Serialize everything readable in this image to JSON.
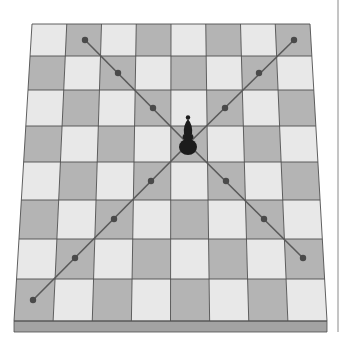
{
  "figure": {
    "description": "Chessboard in perspective with a dark bishop at the center and its diagonal lines of movement marked with dots",
    "piece": {
      "type": "bishop",
      "color": "black",
      "icon": "bishop-icon",
      "row": 3,
      "col": 4
    },
    "colors": {
      "light_square": "#e8e8e8",
      "dark_square": "#b4b4b4",
      "grid_line": "#4f4f4f",
      "board_edge": "#a3a3a3",
      "move_line": "#5a5a5a",
      "move_dot": "#4a4a4a",
      "piece": "#1c1c1c",
      "frame_line": "#8a8a8a"
    },
    "board": {
      "rows": 8,
      "cols": 8,
      "top_left": [
        32,
        24
      ],
      "top_right": [
        310,
        24
      ],
      "bottom_left": [
        14,
        321
      ],
      "bottom_right": [
        327,
        321
      ],
      "row_y": [
        24,
        56,
        90,
        126,
        162,
        200,
        239,
        279,
        321
      ],
      "edge_depth": 11,
      "top_row_starts_with": "light"
    },
    "diagonals": [
      {
        "name": "up-left",
        "from": [
          188,
          144
        ],
        "to": [
          85,
          40
        ],
        "dots": [
          [
            153,
            108
          ],
          [
            118,
            73
          ],
          [
            85,
            40
          ]
        ]
      },
      {
        "name": "up-right",
        "from": [
          188,
          144
        ],
        "to": [
          294,
          40
        ],
        "dots": [
          [
            225,
            108
          ],
          [
            259,
            73
          ],
          [
            294,
            40
          ]
        ]
      },
      {
        "name": "down-left",
        "from": [
          188,
          144
        ],
        "to": [
          33,
          300
        ],
        "dots": [
          [
            151,
            181
          ],
          [
            114,
            219
          ],
          [
            75,
            258
          ],
          [
            33,
            300
          ]
        ]
      },
      {
        "name": "down-right",
        "from": [
          188,
          144
        ],
        "to": [
          303,
          258
        ],
        "dots": [
          [
            226,
            181
          ],
          [
            264,
            219
          ],
          [
            303,
            258
          ]
        ]
      }
    ],
    "frame_line": {
      "x": 338,
      "y1": 0,
      "y2": 332
    }
  }
}
